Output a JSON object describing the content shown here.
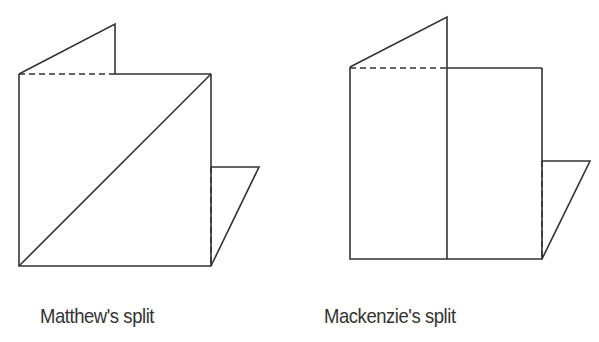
{
  "figures": [
    {
      "caption": "Matthew's split",
      "description": "Folded square with a diagonal cut line",
      "split": "diagonal"
    },
    {
      "caption": "Mackenzie's split",
      "description": "Folded square with a vertical cut line",
      "split": "vertical"
    }
  ],
  "colors": {
    "stroke": "#333333",
    "background": "#ffffff"
  }
}
